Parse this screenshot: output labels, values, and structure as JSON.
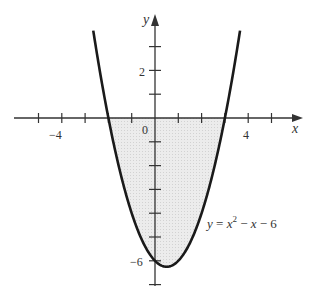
{
  "chart_data": {
    "type": "line",
    "title": "",
    "xlabel": "x",
    "ylabel": "y",
    "function": "y = x^2 - x - 6",
    "annotation": {
      "text": "y = x² − x − 6",
      "x": 2.3,
      "y": -4.6
    },
    "xlim": [
      -5.3,
      6.3
    ],
    "ylim": [
      -7,
      4.2
    ],
    "x_ticks": [
      -5,
      -4,
      -3,
      -2,
      -1,
      0,
      1,
      2,
      3,
      4,
      5
    ],
    "x_tick_labels": [
      {
        "value": -4,
        "label": "−4"
      },
      {
        "value": 0,
        "label": "0"
      },
      {
        "value": 4,
        "label": "4"
      }
    ],
    "y_ticks": [
      3,
      2,
      1,
      -1,
      -2,
      -3,
      -4,
      -5,
      -6,
      -7
    ],
    "y_tick_labels": [
      {
        "value": 2,
        "label": "2"
      },
      {
        "value": -6,
        "label": "−6"
      }
    ],
    "x_domain": [
      -2.65,
      3.65
    ],
    "shaded_region": {
      "description": "area between curve and x-axis",
      "from": -2,
      "to": 3
    },
    "series": [
      {
        "name": "y = x^2 - x - 6",
        "x": [
          -2.65,
          -2,
          -1,
          0,
          0.5,
          1,
          2,
          3,
          3.65
        ],
        "y": [
          3.67,
          0,
          -4,
          -6,
          -6.25,
          -6,
          -4,
          0,
          3.67
        ]
      }
    ],
    "grid": false,
    "legend": null
  },
  "labels": {
    "x_axis": "x",
    "y_axis": "y",
    "origin": "0",
    "x_neg4": "−4",
    "x_pos4": "4",
    "y_pos2": "2",
    "y_neg6": "−6",
    "eq_y": "y",
    "eq_eq": " = ",
    "eq_x": "x",
    "eq_sup": "2",
    "eq_rest1": " − ",
    "eq_x2": "x",
    "eq_rest2": " − 6"
  },
  "colors": {
    "curve": "#1a1a1a",
    "axis": "#333333",
    "shade": "#e6e6e6"
  }
}
